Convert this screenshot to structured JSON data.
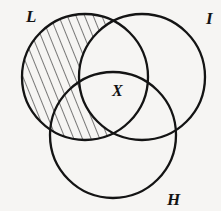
{
  "figure": {
    "type": "venn-diagram",
    "background_color": "#f6f5f3",
    "stroke_color": "#141414",
    "hatch_color": "#1a1a1a",
    "width": 221,
    "height": 211
  },
  "sets": [
    {
      "key": "L",
      "label": "L",
      "label_position": "top-left",
      "center_x": 85,
      "center_y": 77,
      "radius": 63,
      "shaded": true
    },
    {
      "key": "I",
      "label": "I",
      "label_position": "top-right",
      "center_x": 142,
      "center_y": 77,
      "radius": 63,
      "shaded": false
    },
    {
      "key": "H",
      "label": "H",
      "label_position": "bottom-right",
      "center_x": 113,
      "center_y": 135,
      "radius": 63,
      "shaded": false
    }
  ],
  "regions": [
    {
      "key": "X",
      "label": "X",
      "description": "triple intersection of L, I and H",
      "center_x": 119,
      "center_y": 92
    }
  ],
  "shading": {
    "style": "diagonal-hatch",
    "angle_degrees": 22,
    "spacing_px": 7.5,
    "line_width_px": 1.1,
    "region_description": "L minus I"
  }
}
